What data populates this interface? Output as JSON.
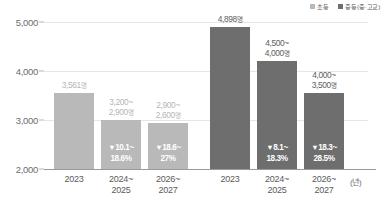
{
  "legend": {
    "items": [
      {
        "label": "초등",
        "color": "#b9b9b9",
        "icon": "square-swatch-icon"
      },
      {
        "label": "중등(중·고교)",
        "color": "#6e6e6e",
        "icon": "square-swatch-icon"
      }
    ]
  },
  "axis": {
    "y_ticks": [
      "5,000",
      "4,000",
      "3,000",
      "2,000"
    ],
    "x_unit": "(년)"
  },
  "chart_data": {
    "type": "bar",
    "title": "",
    "xlabel": "",
    "ylabel": "",
    "ylim": [
      2000,
      5000
    ],
    "grid": true,
    "legend_position": "top-right",
    "categories": [
      "2023",
      "2024~\n2025",
      "2026~\n2027"
    ],
    "series": [
      {
        "name": "초등",
        "color": "#b9b9b9",
        "values": [
          3561,
          3000,
          2940
        ],
        "value_labels": [
          "3,561명",
          "3,200~\n2,900명",
          "2,900~\n2,600명"
        ],
        "change_labels": [
          "",
          "10.1~\n18.6%",
          "18.6~\n27%"
        ]
      },
      {
        "name": "중등(중·고교)",
        "color": "#6e6e6e",
        "values": [
          4898,
          4200,
          3550
        ],
        "value_labels": [
          "4,898명",
          "4,500~\n4,000명",
          "4,000~\n3,500명"
        ],
        "change_labels": [
          "",
          "8.1~\n18.3%",
          "18.3~\n28.5%"
        ]
      }
    ],
    "bars": [
      {
        "group": "초등",
        "category": "2023",
        "top_value": 3561,
        "value_label_line1": "3,561",
        "value_label_line2": "",
        "unit": "명",
        "pct_line1": "",
        "pct_line2": "",
        "color": "#b9b9b9"
      },
      {
        "group": "초등",
        "category": "2024~2025",
        "top_value": 3000,
        "value_label_line1": "3,200~",
        "value_label_line2": "2,900",
        "unit": "명",
        "pct_line1": "10.1~",
        "pct_line2": "18.6%",
        "color": "#b9b9b9"
      },
      {
        "group": "초등",
        "category": "2026~2027",
        "top_value": 2940,
        "value_label_line1": "2,900~",
        "value_label_line2": "2,600",
        "unit": "명",
        "pct_line1": "18.6~",
        "pct_line2": "27%",
        "color": "#b9b9b9"
      },
      {
        "group": "중등(중·고교)",
        "category": "2023",
        "top_value": 4898,
        "value_label_line1": "4,898",
        "value_label_line2": "",
        "unit": "명",
        "pct_line1": "",
        "pct_line2": "",
        "color": "#6e6e6e"
      },
      {
        "group": "중등(중·고교)",
        "category": "2024~2025",
        "top_value": 4200,
        "value_label_line1": "4,500~",
        "value_label_line2": "4,000",
        "unit": "명",
        "pct_line1": "8.1~",
        "pct_line2": "18.3%",
        "color": "#6e6e6e"
      },
      {
        "group": "중등(중·고교)",
        "category": "2026~2027",
        "top_value": 3550,
        "value_label_line1": "4,000~",
        "value_label_line2": "3,500",
        "unit": "명",
        "pct_line1": "18.3~",
        "pct_line2": "28.5%",
        "color": "#6e6e6e"
      }
    ],
    "x_tick_labels": [
      {
        "line1": "2023",
        "line2": ""
      },
      {
        "line1": "2024~",
        "line2": "2025"
      },
      {
        "line1": "2026~",
        "line2": "2027"
      },
      {
        "line1": "2023",
        "line2": ""
      },
      {
        "line1": "2024~",
        "line2": "2025"
      },
      {
        "line1": "2026~",
        "line2": "2027"
      }
    ],
    "arrow_glyph": "▼"
  }
}
